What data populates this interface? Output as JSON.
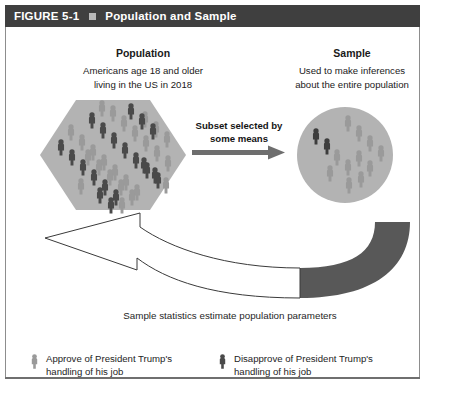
{
  "header": {
    "figure_label": "FIGURE 5-1",
    "bullet_icon": "square-bullet-icon",
    "title": "Population and Sample"
  },
  "population": {
    "title": "Population",
    "line1": "Americans age 18 and older",
    "line2": "living in the US in 2018"
  },
  "sample": {
    "title": "Sample",
    "line1": "Used to make inferences",
    "line2": "about the entire population"
  },
  "subset_arrow": {
    "line1": "Subset selected by",
    "line2": "some means",
    "icon": "right-arrow-icon"
  },
  "feedback_arrow": {
    "icon": "curved-arrow-icon",
    "caption": "Sample statistics estimate population parameters"
  },
  "legend": [
    {
      "icon": "person-icon-light",
      "swatch": "#9a9a9a",
      "line1": "Approve of President Trump's",
      "line2": "handling of his job"
    },
    {
      "icon": "person-icon-dark",
      "swatch": "#4a4a4a",
      "line1": "Disapprove of President Trump's",
      "line2": "handling of his job"
    }
  ],
  "colors": {
    "header_bar": "#3f3f3f",
    "population_shape": "#b3b3b3",
    "sample_shape": "#b3b3b3",
    "person_dark": "#4a4a4a",
    "person_light": "#9a9a9a",
    "arrow_gray": "#6e6e6e",
    "curved_arrow_dark": "#585858",
    "frame_line": "#8d8d8d"
  },
  "counts": {
    "population_people": 43,
    "sample_people": 13
  }
}
